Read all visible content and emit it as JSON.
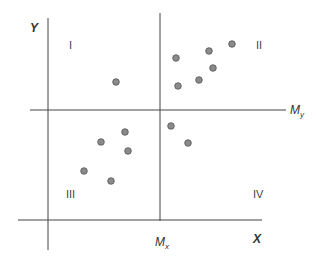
{
  "diagram": {
    "type": "scatter-quadrant",
    "axes": {
      "x_label": "X",
      "y_label": "Y",
      "x_mean_label": "M",
      "x_mean_sub": "x",
      "y_mean_label": "M",
      "y_mean_sub": "y"
    },
    "quadrants": {
      "top_left": "I",
      "top_right": "II",
      "bottom_left": "III",
      "bottom_right": "IV"
    },
    "colors": {
      "line": "#444444",
      "dot_fill": "#8a8a8a",
      "dot_stroke": "#555555"
    },
    "points": [
      {
        "x": 116,
        "y": 82
      },
      {
        "x": 176,
        "y": 58
      },
      {
        "x": 209,
        "y": 51
      },
      {
        "x": 232,
        "y": 44
      },
      {
        "x": 213,
        "y": 68
      },
      {
        "x": 199,
        "y": 80
      },
      {
        "x": 178,
        "y": 86
      },
      {
        "x": 171,
        "y": 126
      },
      {
        "x": 188,
        "y": 143
      },
      {
        "x": 125,
        "y": 132
      },
      {
        "x": 101,
        "y": 142
      },
      {
        "x": 128,
        "y": 151
      },
      {
        "x": 84,
        "y": 171
      },
      {
        "x": 111,
        "y": 181
      }
    ]
  }
}
